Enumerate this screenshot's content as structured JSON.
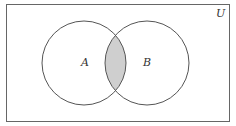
{
  "diagram": {
    "type": "venn",
    "universe_label": "U",
    "sets": [
      {
        "label": "A"
      },
      {
        "label": "B"
      }
    ],
    "shaded_region": "A ∩ B",
    "colors": {
      "background": "#ffffff",
      "stroke": "#555555",
      "shade": "#cfcfcf"
    }
  }
}
